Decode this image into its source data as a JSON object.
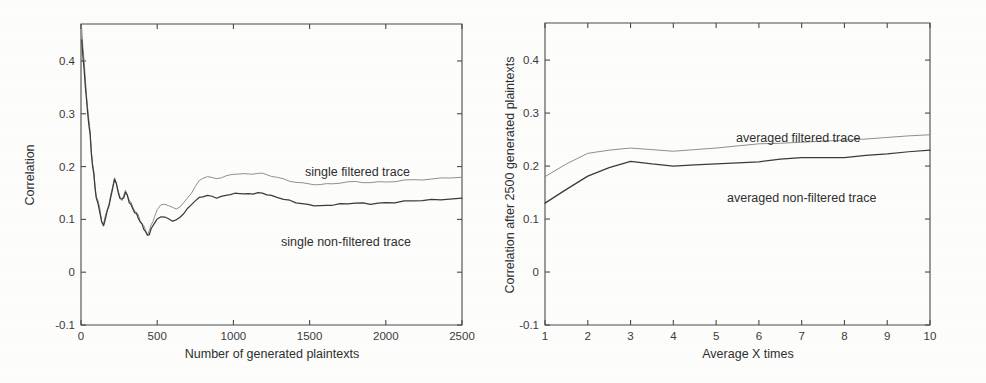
{
  "figure": {
    "background": "#fdfdfc",
    "axis_color": "#4a4a4a",
    "filtered_color": "#8f8f8f",
    "nonfiltered_color": "#3b3b3b"
  },
  "chart_data": [
    {
      "type": "line",
      "panel": "left",
      "title": "",
      "xlabel": "Number of generated plaintexts",
      "ylabel": "Correlation",
      "xlim": [
        0,
        2500
      ],
      "ylim": [
        -0.1,
        0.47
      ],
      "grid": false,
      "legend_position": "inline-annotation",
      "xticks": [
        0,
        500,
        1000,
        1500,
        2000,
        2500
      ],
      "xticklabels": [
        "0",
        "500",
        "1000",
        "1500",
        "2000",
        "2500"
      ],
      "yticks": [
        -0.1,
        0,
        0.1,
        0.2,
        0.3,
        0.4
      ],
      "yticklabels": [
        "-0.1",
        "0",
        "0.1",
        "0.2",
        "0.3",
        "0.4"
      ],
      "x": [
        5,
        12,
        20,
        28,
        36,
        44,
        52,
        60,
        68,
        76,
        84,
        92,
        100,
        112,
        124,
        136,
        148,
        160,
        172,
        184,
        196,
        208,
        220,
        232,
        244,
        256,
        268,
        280,
        292,
        304,
        316,
        328,
        340,
        352,
        364,
        376,
        388,
        400,
        412,
        424,
        436,
        448,
        460,
        472,
        484,
        500,
        525,
        550,
        575,
        600,
        625,
        650,
        675,
        700,
        725,
        750,
        775,
        800,
        830,
        860,
        890,
        920,
        950,
        980,
        1010,
        1040,
        1070,
        1100,
        1130,
        1160,
        1190,
        1220,
        1250,
        1290,
        1330,
        1370,
        1410,
        1450,
        1490,
        1530,
        1570,
        1610,
        1650,
        1700,
        1750,
        1800,
        1850,
        1900,
        1950,
        2000,
        2060,
        2120,
        2180,
        2240,
        2300,
        2360,
        2420,
        2500
      ],
      "series": [
        {
          "name": "single filtered trace",
          "label": "single filtered trace",
          "color": "#8f8f8f",
          "values": [
            0.46,
            0.43,
            0.4,
            0.365,
            0.335,
            0.31,
            0.285,
            0.265,
            0.23,
            0.205,
            0.19,
            0.165,
            0.145,
            0.135,
            0.12,
            0.098,
            0.092,
            0.105,
            0.118,
            0.13,
            0.145,
            0.16,
            0.18,
            0.168,
            0.152,
            0.143,
            0.138,
            0.145,
            0.155,
            0.148,
            0.138,
            0.131,
            0.124,
            0.118,
            0.112,
            0.106,
            0.098,
            0.092,
            0.085,
            0.078,
            0.072,
            0.078,
            0.088,
            0.098,
            0.108,
            0.118,
            0.128,
            0.13,
            0.126,
            0.122,
            0.12,
            0.124,
            0.131,
            0.14,
            0.15,
            0.162,
            0.172,
            0.178,
            0.182,
            0.179,
            0.177,
            0.18,
            0.183,
            0.184,
            0.186,
            0.187,
            0.186,
            0.185,
            0.186,
            0.187,
            0.186,
            0.184,
            0.182,
            0.179,
            0.176,
            0.173,
            0.171,
            0.169,
            0.168,
            0.167,
            0.166,
            0.167,
            0.168,
            0.169,
            0.17,
            0.171,
            0.17,
            0.169,
            0.17,
            0.171,
            0.172,
            0.174,
            0.175,
            0.176,
            0.177,
            0.178,
            0.179,
            0.181,
            0.182
          ]
        },
        {
          "name": "single non-filtered trace",
          "label": "single non-filtered trace",
          "color": "#3b3b3b",
          "values": [
            0.44,
            0.41,
            0.385,
            0.355,
            0.325,
            0.3,
            0.278,
            0.258,
            0.225,
            0.2,
            0.185,
            0.162,
            0.14,
            0.13,
            0.115,
            0.094,
            0.09,
            0.102,
            0.115,
            0.128,
            0.142,
            0.157,
            0.177,
            0.165,
            0.15,
            0.14,
            0.136,
            0.142,
            0.152,
            0.145,
            0.135,
            0.128,
            0.121,
            0.115,
            0.11,
            0.103,
            0.096,
            0.089,
            0.082,
            0.075,
            0.068,
            0.072,
            0.08,
            0.088,
            0.095,
            0.1,
            0.106,
            0.105,
            0.101,
            0.098,
            0.099,
            0.104,
            0.112,
            0.12,
            0.128,
            0.135,
            0.14,
            0.143,
            0.145,
            0.143,
            0.141,
            0.143,
            0.146,
            0.148,
            0.149,
            0.15,
            0.149,
            0.148,
            0.149,
            0.15,
            0.149,
            0.147,
            0.144,
            0.141,
            0.138,
            0.135,
            0.132,
            0.13,
            0.128,
            0.127,
            0.126,
            0.127,
            0.128,
            0.129,
            0.13,
            0.131,
            0.13,
            0.129,
            0.13,
            0.131,
            0.132,
            0.134,
            0.135,
            0.136,
            0.137,
            0.138,
            0.139,
            0.14,
            0.142
          ]
        }
      ]
    },
    {
      "type": "line",
      "panel": "right",
      "title": "",
      "xlabel": "Average X times",
      "ylabel": "Correlation after 2500 generated plaintexts",
      "xlim": [
        1,
        10
      ],
      "ylim": [
        -0.1,
        0.47
      ],
      "grid": false,
      "legend_position": "inline-annotation",
      "xticks": [
        1,
        2,
        3,
        4,
        5,
        6,
        7,
        8,
        9,
        10
      ],
      "xticklabels": [
        "1",
        "2",
        "3",
        "4",
        "5",
        "6",
        "7",
        "8",
        "9",
        "10"
      ],
      "yticks": [
        -0.1,
        0,
        0.1,
        0.2,
        0.3,
        0.4
      ],
      "yticklabels": [
        "-0.1",
        "0",
        "0.1",
        "0.2",
        "0.3",
        "0.4"
      ],
      "x": [
        1,
        1.5,
        2,
        2.5,
        3,
        3.5,
        4,
        4.5,
        5,
        5.5,
        6,
        6.5,
        7,
        7.5,
        8,
        8.5,
        9,
        9.5,
        10
      ],
      "series": [
        {
          "name": "averaged filtered trace",
          "label": "averaged filtered trace",
          "color": "#8f8f8f",
          "values": [
            0.18,
            0.204,
            0.224,
            0.23,
            0.234,
            0.231,
            0.228,
            0.231,
            0.234,
            0.238,
            0.242,
            0.243,
            0.245,
            0.247,
            0.249,
            0.251,
            0.254,
            0.257,
            0.259
          ]
        },
        {
          "name": "averaged non-filtered trace",
          "label": "averaged non-filtered trace",
          "color": "#3b3b3b",
          "values": [
            0.13,
            0.156,
            0.181,
            0.197,
            0.209,
            0.204,
            0.2,
            0.202,
            0.204,
            0.206,
            0.208,
            0.213,
            0.216,
            0.216,
            0.216,
            0.22,
            0.223,
            0.227,
            0.23
          ]
        }
      ]
    }
  ]
}
